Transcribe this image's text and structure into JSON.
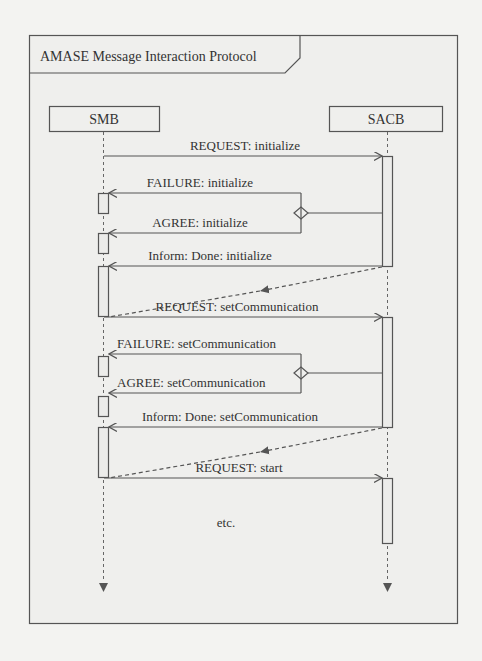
{
  "frame": {
    "title": "AMASE Message Interaction Protocol"
  },
  "lifelines": [
    {
      "id": "smb",
      "label": "SMB"
    },
    {
      "id": "sacb",
      "label": "SACB"
    }
  ],
  "messages": [
    {
      "label": "REQUEST: initialize",
      "from": "SMB",
      "to": "SACB",
      "style": "solid"
    },
    {
      "label": "FAILURE: initialize",
      "from": "SACB",
      "to": "SMB",
      "style": "solid",
      "alt": true
    },
    {
      "label": "AGREE: initialize",
      "from": "SACB",
      "to": "SMB",
      "style": "solid",
      "alt": true
    },
    {
      "label": "Inform: Done: initialize",
      "from": "SACB",
      "to": "SMB",
      "style": "solid"
    },
    {
      "label": "REQUEST: setCommunication",
      "from": "SMB",
      "to": "SACB",
      "style": "solid"
    },
    {
      "label": "FAILURE: setCommunication",
      "from": "SACB",
      "to": "SMB",
      "style": "solid",
      "alt": true
    },
    {
      "label": "AGREE: setCommunication",
      "from": "SACB",
      "to": "SMB",
      "style": "solid",
      "alt": true
    },
    {
      "label": "Inform: Done: setCommunication",
      "from": "SACB",
      "to": "SMB",
      "style": "solid"
    },
    {
      "label": "REQUEST: start",
      "from": "SMB",
      "to": "SACB",
      "style": "solid"
    }
  ],
  "continuation": "etc."
}
